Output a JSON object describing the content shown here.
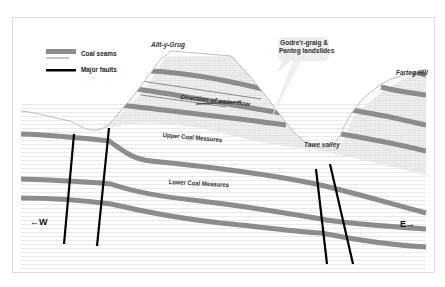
{
  "legend": {
    "items": [
      {
        "label": "Coal seams",
        "type": "seam",
        "color": "#8c8c8c"
      },
      {
        "label": "Major faults",
        "type": "fault",
        "color": "#000000"
      }
    ]
  },
  "places": {
    "allt_y_grug": "Allt-y-Grug",
    "farteg_hill": "Farteg Hill",
    "tawe_valley": "Tawe valley"
  },
  "callout": {
    "line1": "Godre'r-graig &",
    "line2": "Panteg landslides"
  },
  "annotations": {
    "water_flow": "Direction of water flow",
    "upper_coal": "Upper Coal Measures",
    "lower_coal": "Lower Coal Measures"
  },
  "compass": {
    "west": "←W",
    "east": "E→"
  },
  "colors": {
    "seam": "#8c8c8c",
    "fault": "#000000",
    "hatch": "#d8d8d8",
    "ground_line": "#bdbdbd"
  }
}
